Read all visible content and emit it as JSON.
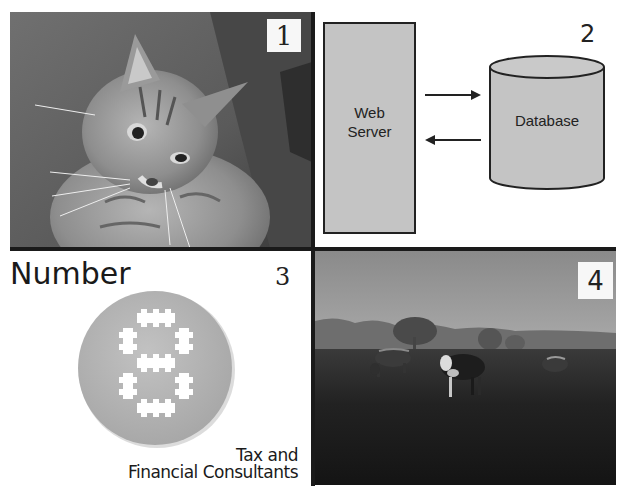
{
  "panels": [
    {
      "number": "1",
      "subject": "tabby cat photo"
    },
    {
      "number": "2",
      "subject": "web server and database diagram",
      "diagram": {
        "server_label_line1": "Web",
        "server_label_line2": "Server",
        "database_label": "Database"
      }
    },
    {
      "number": "3",
      "subject": "Number 8 logo",
      "logo": {
        "title": "Number",
        "digit": "8",
        "tagline_line1": "Tax and",
        "tagline_line2": "Financial Consultants"
      }
    },
    {
      "number": "4",
      "subject": "cows grazing in misty field photo"
    }
  ],
  "colors": {
    "diagram_fill": "#c4c4c4",
    "logo_circle": "#b9b9b9",
    "divider": "#1a1a1a"
  }
}
